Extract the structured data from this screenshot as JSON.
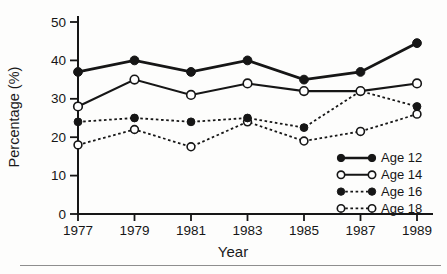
{
  "figure": {
    "background": "#fdfdfc",
    "ink_color": "#161616",
    "bottom_rule_color": "#8e8e8e"
  },
  "chart_data": {
    "type": "line",
    "title": "",
    "xlabel": "Year",
    "ylabel": "Percentage (%)",
    "x": [
      1977,
      1979,
      1981,
      1983,
      1985,
      1987,
      1989
    ],
    "x_tick_labels": [
      "1977",
      "1979",
      "1981",
      "1983",
      "1985",
      "1987",
      "1989"
    ],
    "y_ticks": [
      0,
      10,
      20,
      30,
      40,
      50
    ],
    "y_tick_labels": [
      "0",
      "10",
      "20",
      "30",
      "40",
      "50"
    ],
    "ylim": [
      0,
      50
    ],
    "grid": false,
    "legend_position": "lower right",
    "series": [
      {
        "name": "Age 12",
        "values": [
          37,
          40,
          37,
          40,
          35,
          37,
          44.5
        ],
        "line": "solid-thick",
        "marker": "filled-circle"
      },
      {
        "name": "Age 14",
        "values": [
          28,
          35,
          31,
          34,
          32,
          32,
          34
        ],
        "line": "solid",
        "marker": "open-circle"
      },
      {
        "name": "Age 16",
        "values": [
          24,
          25,
          24,
          25,
          22.5,
          32,
          28
        ],
        "line": "dotted",
        "marker": "filled-circle"
      },
      {
        "name": "Age 18",
        "values": [
          18,
          22,
          17.5,
          24,
          19,
          21.5,
          26
        ],
        "line": "dotted",
        "marker": "open-circle"
      }
    ]
  }
}
